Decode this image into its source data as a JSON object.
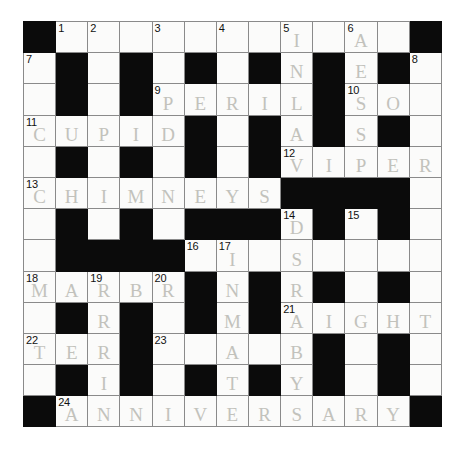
{
  "puzzle": {
    "type": "crossword-grid",
    "rows": 13,
    "cols": 13,
    "paper_color": "#ffffff",
    "block_color": "#0b0b0b",
    "cell_color": "#fbfbfa",
    "grid_line_color": "#8a8a8a",
    "pencil_color": "#b9b9b2",
    "grid": [
      [
        {
          "block": true
        },
        {
          "num": "1",
          "letter": ""
        },
        {
          "num": "2",
          "letter": ""
        },
        {
          "letter": ""
        },
        {
          "num": "3",
          "letter": ""
        },
        {
          "letter": ""
        },
        {
          "num": "4",
          "letter": ""
        },
        {
          "letter": ""
        },
        {
          "num": "5",
          "letter": "I"
        },
        {
          "letter": ""
        },
        {
          "num": "6",
          "letter": "A"
        },
        {
          "letter": ""
        },
        {
          "block": true
        }
      ],
      [
        {
          "num": "7",
          "letter": ""
        },
        {
          "block": true
        },
        {
          "letter": ""
        },
        {
          "block": true
        },
        {
          "letter": ""
        },
        {
          "block": true
        },
        {
          "letter": ""
        },
        {
          "block": true
        },
        {
          "letter": "N"
        },
        {
          "block": true
        },
        {
          "letter": "E"
        },
        {
          "block": true
        },
        {
          "num": "8",
          "letter": ""
        }
      ],
      [
        {
          "letter": ""
        },
        {
          "block": true
        },
        {
          "letter": ""
        },
        {
          "block": true
        },
        {
          "num": "9",
          "letter": "P"
        },
        {
          "letter": "E"
        },
        {
          "letter": "R"
        },
        {
          "letter": "I"
        },
        {
          "letter": "L"
        },
        {
          "block": true
        },
        {
          "num": "10",
          "letter": "S"
        },
        {
          "letter": "O"
        },
        {
          "letter": ""
        }
      ],
      [
        {
          "num": "11",
          "letter": "C"
        },
        {
          "letter": "U"
        },
        {
          "letter": "P"
        },
        {
          "letter": "I"
        },
        {
          "letter": "D"
        },
        {
          "block": true
        },
        {
          "letter": ""
        },
        {
          "block": true
        },
        {
          "letter": "A"
        },
        {
          "block": true
        },
        {
          "letter": "S"
        },
        {
          "block": true
        },
        {
          "letter": ""
        }
      ],
      [
        {
          "letter": ""
        },
        {
          "block": true
        },
        {
          "letter": ""
        },
        {
          "block": true
        },
        {
          "letter": ""
        },
        {
          "block": true
        },
        {
          "letter": ""
        },
        {
          "block": true
        },
        {
          "num": "12",
          "letter": "V"
        },
        {
          "letter": "I"
        },
        {
          "letter": "P"
        },
        {
          "letter": "E"
        },
        {
          "letter": "R"
        }
      ],
      [
        {
          "num": "13",
          "letter": "C"
        },
        {
          "letter": "H"
        },
        {
          "letter": "I"
        },
        {
          "letter": "M"
        },
        {
          "letter": "N"
        },
        {
          "letter": "E"
        },
        {
          "letter": "Y"
        },
        {
          "letter": "S"
        },
        {
          "block": true
        },
        {
          "block": true
        },
        {
          "block": true
        },
        {
          "block": true
        },
        {
          "letter": ""
        }
      ],
      [
        {
          "letter": ""
        },
        {
          "block": true
        },
        {
          "letter": ""
        },
        {
          "block": true
        },
        {
          "letter": ""
        },
        {
          "block": true
        },
        {
          "block": true
        },
        {
          "block": true
        },
        {
          "num": "14",
          "letter": "D"
        },
        {
          "block": true
        },
        {
          "num": "15",
          "letter": ""
        },
        {
          "block": true
        },
        {
          "letter": ""
        }
      ],
      [
        {
          "letter": ""
        },
        {
          "block": true
        },
        {
          "block": true
        },
        {
          "block": true
        },
        {
          "block": true
        },
        {
          "num": "16",
          "letter": ""
        },
        {
          "num": "17",
          "letter": "I"
        },
        {
          "letter": ""
        },
        {
          "letter": "S"
        },
        {
          "letter": ""
        },
        {
          "letter": ""
        },
        {
          "letter": ""
        },
        {
          "letter": ""
        }
      ],
      [
        {
          "num": "18",
          "letter": "M"
        },
        {
          "letter": "A"
        },
        {
          "num": "19",
          "letter": "R"
        },
        {
          "letter": "B"
        },
        {
          "num": "20",
          "letter": "R"
        },
        {
          "block": true
        },
        {
          "letter": "N"
        },
        {
          "block": true
        },
        {
          "letter": "R"
        },
        {
          "block": true
        },
        {
          "letter": ""
        },
        {
          "block": true
        },
        {
          "letter": ""
        }
      ],
      [
        {
          "letter": ""
        },
        {
          "block": true
        },
        {
          "letter": "R"
        },
        {
          "block": true
        },
        {
          "letter": ""
        },
        {
          "block": true
        },
        {
          "letter": "M"
        },
        {
          "block": true
        },
        {
          "num": "21",
          "letter": "A"
        },
        {
          "letter": "I"
        },
        {
          "letter": "G"
        },
        {
          "letter": "H"
        },
        {
          "letter": "T"
        }
      ],
      [
        {
          "num": "22",
          "letter": "T"
        },
        {
          "letter": "E"
        },
        {
          "letter": "R"
        },
        {
          "block": true
        },
        {
          "num": "23",
          "letter": ""
        },
        {
          "letter": ""
        },
        {
          "letter": "A"
        },
        {
          "letter": ""
        },
        {
          "letter": "B"
        },
        {
          "block": true
        },
        {
          "letter": ""
        },
        {
          "block": true
        },
        {
          "letter": ""
        }
      ],
      [
        {
          "letter": ""
        },
        {
          "block": true
        },
        {
          "letter": "I"
        },
        {
          "block": true
        },
        {
          "letter": ""
        },
        {
          "block": true
        },
        {
          "letter": "T"
        },
        {
          "block": true
        },
        {
          "letter": "Y"
        },
        {
          "block": true
        },
        {
          "letter": ""
        },
        {
          "block": true
        },
        {
          "letter": ""
        }
      ],
      [
        {
          "block": true
        },
        {
          "num": "24",
          "letter": "A"
        },
        {
          "letter": "N"
        },
        {
          "letter": "N"
        },
        {
          "letter": "I"
        },
        {
          "letter": "V"
        },
        {
          "letter": "E"
        },
        {
          "letter": "R"
        },
        {
          "letter": "S"
        },
        {
          "letter": "A"
        },
        {
          "letter": "R"
        },
        {
          "letter": "Y"
        },
        {
          "block": true
        }
      ]
    ]
  }
}
